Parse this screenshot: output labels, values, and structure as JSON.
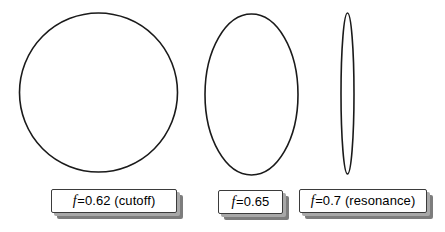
{
  "figure": {
    "background_color": "#ffffff",
    "stroke_color": "#1a1a1a",
    "shadow_color": "#7d7d7d"
  },
  "shapes": [
    {
      "name": "circle-cutoff",
      "kind": "ellipse",
      "cx": 98.5,
      "cy": 92.5,
      "rx": 79,
      "ry": 79.5,
      "description": "circular mode cross-section"
    },
    {
      "name": "ellipse-medium",
      "kind": "ellipse",
      "cx": 251.5,
      "cy": 94.5,
      "rx": 46.5,
      "ry": 80.5,
      "description": "vertically elongated ellipse"
    },
    {
      "name": "ellipse-narrow",
      "kind": "ellipse",
      "cx": 347.5,
      "cy": 93.5,
      "rx": 6.5,
      "ry": 80.5,
      "description": "very narrow vertical ellipse at resonance"
    }
  ],
  "labels": [
    {
      "id": "label-cutoff",
      "symbol": "f",
      "text": "=0.62 (cutoff)",
      "full_text": "f=0.62 (cutoff)",
      "frequency": 0.62,
      "annotation": "cutoff"
    },
    {
      "id": "label-065",
      "symbol": "f",
      "text": "=0.65",
      "full_text": "f=0.65",
      "frequency": 0.65,
      "annotation": ""
    },
    {
      "id": "label-resonance",
      "symbol": "f",
      "text": "=0.7 (resonance)",
      "full_text": "f=0.7 (resonance)",
      "frequency": 0.7,
      "annotation": "resonance"
    }
  ]
}
